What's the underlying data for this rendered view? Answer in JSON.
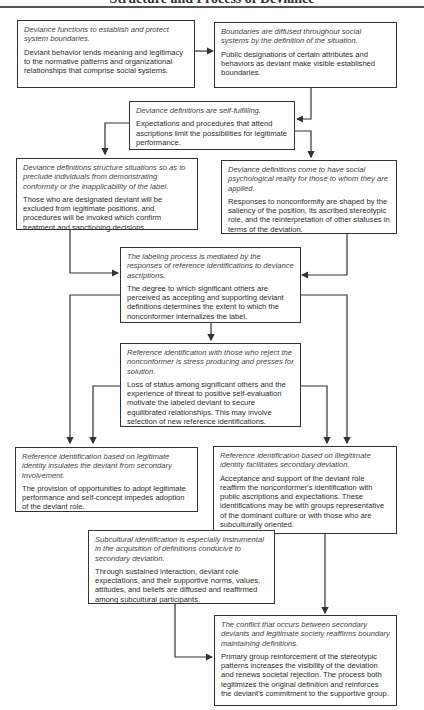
{
  "header": {
    "title": "Structure and Process of Deviance"
  },
  "boxes": {
    "b1": {
      "heading": "Deviance functions to establish and protect system boundaries.",
      "body": "Deviant behavior lends meaning and legitimacy to the normative patterns and organizational relationships that comprise social systems."
    },
    "b2": {
      "heading": "Boundaries are diffused throughout social systems by the definition of the situation.",
      "body": "Public designations of certain attributes and behaviors as deviant make visible established boundaries."
    },
    "b3": {
      "heading": "Deviance definitions are self-fulfilling.",
      "body": "Expectations and procedures that attend ascriptions limit the possibilities for legitimate performance."
    },
    "b4": {
      "heading": "Deviance definitions structure situations so as to preclude individuals from demonstrating conformity or the inapplicability of the label.",
      "body": "Those who are designated deviant will be excluded from legitimate positions, and procedures will be invoked which confirm treatment and sanctioning decisions."
    },
    "b5": {
      "heading": "Deviance definitions come to have social psychological reality for those to whom they are applied.",
      "body": "Responses to nonconformity are shaped by the saliency of the position, its ascribed stereotypic role, and the reinterpretation of other statuses in terms of the deviation."
    },
    "b6": {
      "heading": "The labeling process is mediated by the responses of reference identifications to deviance ascriptions.",
      "body": "The degree to which significant others are perceived as accepting and supporting deviant definitions determines the extent to which the nonconformer internalizes the label."
    },
    "b7": {
      "heading": "Reference identification with those who reject the nonconformer is stress producing and presses for solution.",
      "body": "Loss of status among significant others and the experience of threat to positive self-evaluation motivate the labeled deviant to secure equilibrated relationships. This may involve selection of new reference identifications."
    },
    "b8": {
      "heading": "Reference identification based on legitimate identity insulates the deviant from secondary involvement.",
      "body": "The provision of opportunities to adopt legitimate performance and self-concept impedes adoption of the deviant role."
    },
    "b9": {
      "heading": "Reference identification based on illegitimate identity facilitates secondary deviation.",
      "body": "Acceptance and support of the deviant role reaffirm the nonconformer's identification with public ascriptions and expectations. These identifications may be with groups representative of the dominant culture or with those who are subculturally oriented."
    },
    "b10": {
      "heading": "Subcultural identification is especially instrumental in the acquisition of definitions conducive to secondary deviation.",
      "body": "Through sustained interaction, deviant role expectations, and their supportive norms, values, attitudes, and beliefs are diffused and reaffirmed among subcultural participants."
    },
    "b11": {
      "heading": "The conflict that occurs between secondary deviants and legitimate society reaffirms boundary maintaining definitions.",
      "body": "Primary group reinforcement of the stereotypic patterns increases the visibility of the deviation and renews societal rejection. The process both legitimizes the original definition and reinforces the deviant's commitment to the supportive group."
    }
  }
}
